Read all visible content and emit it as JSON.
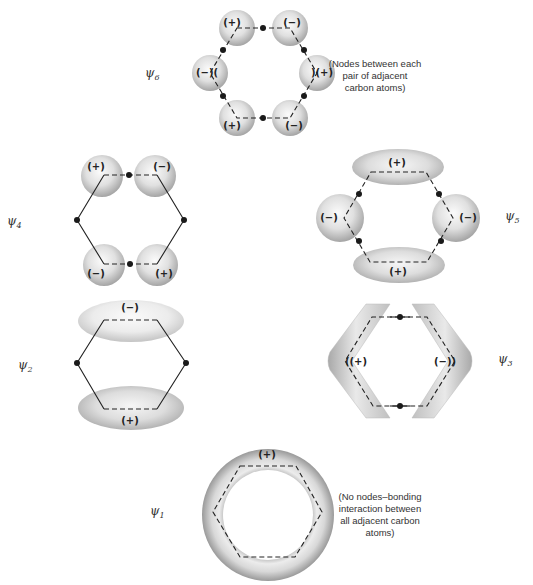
{
  "diagram": {
    "type": "benzene-pi-molecular-orbitals",
    "orbitals": [
      {
        "id": "psi6",
        "label": "ψ",
        "subscript": "6",
        "lobes": [
          {
            "position": "top-left",
            "sign": "(+)"
          },
          {
            "position": "top-right",
            "sign": "(−)"
          },
          {
            "position": "right",
            "sign": ")(+)"
          },
          {
            "position": "bottom-right",
            "sign": "(−)"
          },
          {
            "position": "bottom-left",
            "sign": "(+)"
          },
          {
            "position": "left",
            "sign": "(−)("
          }
        ],
        "nodes": 6,
        "note": [
          "(Nodes between each",
          "pair of adjacent",
          "carbon atoms)"
        ]
      },
      {
        "id": "psi4",
        "label": "ψ",
        "subscript": "4",
        "lobes": [
          {
            "position": "top-left",
            "sign": "(+)"
          },
          {
            "position": "top-right",
            "sign": "(−)"
          },
          {
            "position": "bottom-left",
            "sign": "(−)"
          },
          {
            "position": "bottom-right",
            "sign": "(+)"
          }
        ],
        "nodes": 4
      },
      {
        "id": "psi5",
        "label": "ψ",
        "subscript": "5",
        "lobes": [
          {
            "position": "top",
            "sign": "(+)"
          },
          {
            "position": "left",
            "sign": "(−)"
          },
          {
            "position": "right",
            "sign": "(−)"
          },
          {
            "position": "bottom",
            "sign": "(+)"
          }
        ],
        "nodes": 4
      },
      {
        "id": "psi2",
        "label": "ψ",
        "subscript": "2",
        "lobes": [
          {
            "position": "top",
            "sign": "(−)"
          },
          {
            "position": "bottom",
            "sign": "(+)"
          }
        ],
        "nodes": 2
      },
      {
        "id": "psi3",
        "label": "ψ",
        "subscript": "3",
        "lobes": [
          {
            "position": "left",
            "sign": "((+)"
          },
          {
            "position": "right",
            "sign": "(−))"
          }
        ],
        "nodes": 2
      },
      {
        "id": "psi1",
        "label": "ψ",
        "subscript": "1",
        "lobes": [
          {
            "position": "ring",
            "sign": "(+)"
          }
        ],
        "nodes": 0,
        "note": [
          "(No nodes–bonding",
          "interaction between",
          "all adjacent carbon",
          "atoms)"
        ]
      }
    ],
    "colors": {
      "lobe_light": "#f4f4f4",
      "lobe_dark": "#a8a8a8",
      "line": "#222222",
      "background": "#ffffff"
    }
  }
}
